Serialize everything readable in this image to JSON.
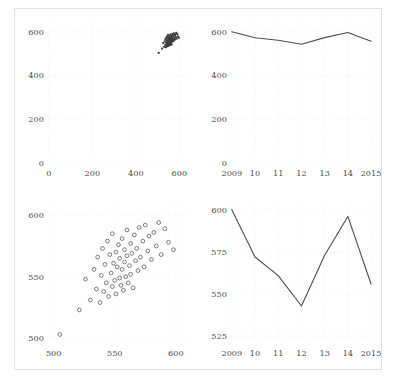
{
  "figure": {
    "background": "#ffffff",
    "border_color": "#e2e2e2",
    "tick_color": "#4a4a4a",
    "grid_color": "#ebebeb",
    "line_color": "#4d4d4d",
    "marker_color": "#5a5a5a"
  },
  "chart_data": [
    {
      "panel": "top-left",
      "type": "scatter",
      "title": "",
      "xlabel": "",
      "ylabel": "",
      "xlim": [
        0,
        640
      ],
      "ylim": [
        0,
        640
      ],
      "xticks": [
        0,
        200,
        400,
        600
      ],
      "yticks": [
        0,
        200,
        400,
        600
      ],
      "xticklabels": [
        "0",
        "200",
        "400",
        "600"
      ],
      "yticklabels": [
        "0",
        "200",
        "400",
        "600"
      ],
      "grid": true,
      "legend": "none",
      "note": "Same data as bottom-left panel but drawn on a full 0-600 axis, so all points collapse into one dense cluster near (555,555).",
      "x": [
        521,
        526,
        530,
        533,
        535,
        536,
        538,
        539,
        540,
        541,
        542,
        543,
        544,
        545,
        546,
        547,
        548,
        548,
        549,
        550,
        551,
        551,
        552,
        553,
        554,
        554,
        555,
        556,
        556,
        557,
        558,
        558,
        559,
        560,
        560,
        561,
        562,
        563,
        563,
        564,
        565,
        566,
        567,
        568,
        569,
        570,
        571,
        573,
        574,
        575,
        577,
        578,
        580,
        582,
        584,
        586,
        588,
        591,
        594,
        598,
        505
      ],
      "y": [
        523,
        548,
        531,
        556,
        540,
        566,
        529,
        551,
        573,
        538,
        560,
        545,
        579,
        534,
        568,
        553,
        542,
        585,
        561,
        547,
        570,
        536,
        558,
        576,
        549,
        565,
        543,
        581,
        556,
        539,
        572,
        562,
        550,
        588,
        567,
        545,
        559,
        577,
        552,
        569,
        541,
        584,
        563,
        573,
        555,
        590,
        566,
        579,
        558,
        592,
        571,
        583,
        564,
        586,
        575,
        594,
        568,
        589,
        578,
        572,
        503
      ],
      "marker": "o",
      "marker_style": "open-circle"
    },
    {
      "panel": "top-right",
      "type": "line",
      "title": "",
      "xlabel": "",
      "ylabel": "",
      "xlim": [
        2009,
        2015
      ],
      "ylim": [
        0,
        640
      ],
      "xticks": [
        2009,
        2010,
        2011,
        2012,
        2013,
        2014,
        2015
      ],
      "yticks": [
        0,
        200,
        400,
        600
      ],
      "xticklabels": [
        "2009",
        "10",
        "11",
        "12",
        "13",
        "14",
        "2015"
      ],
      "yticklabels": [
        "0",
        "200",
        "400",
        "600"
      ],
      "grid": true,
      "legend": "none",
      "note": "Same series as bottom-right panel but drawn on a full 0-600 axis, so the line looks almost perfectly flat.",
      "categories": [
        "2009",
        "10",
        "11",
        "12",
        "13",
        "14",
        "2015"
      ],
      "values": [
        600,
        572,
        561,
        543,
        573,
        596,
        556
      ]
    },
    {
      "panel": "bottom-left",
      "type": "scatter",
      "title": "",
      "xlabel": "",
      "ylabel": "",
      "xlim": [
        496,
        610
      ],
      "ylim": [
        496,
        610
      ],
      "xticks": [
        500,
        550,
        600
      ],
      "yticks": [
        500,
        550,
        600
      ],
      "xticklabels": [
        "500",
        "550",
        "600"
      ],
      "yticklabels": [
        "500",
        "550",
        "600"
      ],
      "grid": true,
      "legend": "none",
      "note": "Zoomed view of the top-left data: reveals open-circle markers with a clear positive correlation.",
      "x": [
        521,
        526,
        530,
        533,
        535,
        536,
        538,
        539,
        540,
        541,
        542,
        543,
        544,
        545,
        546,
        547,
        548,
        548,
        549,
        550,
        551,
        551,
        552,
        553,
        554,
        554,
        555,
        556,
        556,
        557,
        558,
        558,
        559,
        560,
        560,
        561,
        562,
        563,
        563,
        564,
        565,
        566,
        567,
        568,
        569,
        570,
        571,
        573,
        574,
        575,
        577,
        578,
        580,
        582,
        584,
        586,
        588,
        591,
        594,
        598,
        505
      ],
      "y": [
        523,
        548,
        531,
        556,
        540,
        566,
        529,
        551,
        573,
        538,
        560,
        545,
        579,
        534,
        568,
        553,
        542,
        585,
        561,
        547,
        570,
        536,
        558,
        576,
        549,
        565,
        543,
        581,
        556,
        539,
        572,
        562,
        550,
        588,
        567,
        545,
        559,
        577,
        552,
        569,
        541,
        584,
        563,
        573,
        555,
        590,
        566,
        579,
        558,
        592,
        571,
        583,
        564,
        586,
        575,
        594,
        568,
        589,
        578,
        572,
        503
      ],
      "marker": "o",
      "marker_style": "open-circle"
    },
    {
      "panel": "bottom-right",
      "type": "line",
      "title": "",
      "xlabel": "",
      "ylabel": "",
      "xlim": [
        2009,
        2015
      ],
      "ylim": [
        521,
        604
      ],
      "xticks": [
        2009,
        2010,
        2011,
        2012,
        2013,
        2014,
        2015
      ],
      "yticks": [
        525,
        550,
        575,
        600
      ],
      "xticklabels": [
        "2009",
        "10",
        "11",
        "12",
        "13",
        "14",
        "2015"
      ],
      "yticklabels": [
        "525",
        "550",
        "575",
        "600"
      ],
      "grid": true,
      "legend": "none",
      "note": "Zoomed view of the top-right series: reveals a pronounced decline to 2012, a rise to a 2014 peak, then a sharp drop.",
      "categories": [
        "2009",
        "10",
        "11",
        "12",
        "13",
        "14",
        "2015"
      ],
      "values": [
        600,
        572,
        561,
        543,
        573,
        596,
        556
      ]
    }
  ]
}
